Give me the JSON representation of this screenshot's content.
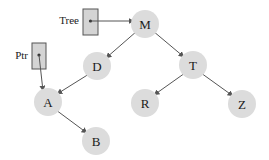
{
  "diagram": {
    "type": "binary-search-tree",
    "colors": {
      "node_fill": "#dcdcdc",
      "edge": "#555555",
      "box_fill": "#d4d4d4",
      "box_stroke": "#555555",
      "text": "#1a1a1a"
    },
    "pointers": [
      {
        "id": "tree",
        "label": "Tree",
        "points_to": "M"
      },
      {
        "id": "ptr",
        "label": "Ptr",
        "points_to": "A"
      }
    ],
    "nodes": [
      {
        "id": "M",
        "label": "M"
      },
      {
        "id": "D",
        "label": "D"
      },
      {
        "id": "T",
        "label": "T"
      },
      {
        "id": "A",
        "label": "A"
      },
      {
        "id": "R",
        "label": "R"
      },
      {
        "id": "Z",
        "label": "Z"
      },
      {
        "id": "B",
        "label": "B"
      }
    ],
    "edges": [
      {
        "from": "M",
        "to": "D"
      },
      {
        "from": "M",
        "to": "T"
      },
      {
        "from": "D",
        "to": "A"
      },
      {
        "from": "T",
        "to": "R"
      },
      {
        "from": "T",
        "to": "Z"
      },
      {
        "from": "A",
        "to": "B"
      }
    ]
  }
}
